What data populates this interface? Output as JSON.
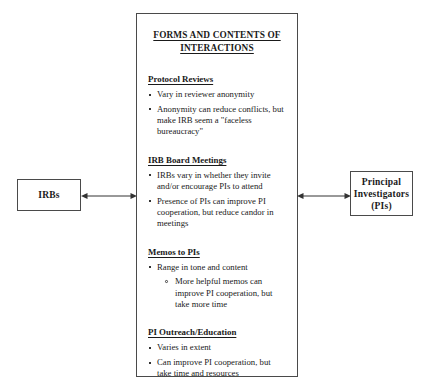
{
  "diagram": {
    "left_box": {
      "label": "IRBs",
      "lines": [
        "IRBs"
      ]
    },
    "right_box": {
      "label": "Principal Investigators (PIs)",
      "lines": [
        "Principal",
        "Investigators",
        "(PIs)"
      ]
    },
    "center_box": {
      "title_lines": [
        "FORMS AND CONTENTS OF",
        "INTERACTIONS"
      ],
      "sections": [
        {
          "heading": "Protocol Reviews",
          "bullets": [
            {
              "text": "Vary in reviewer anonymity",
              "subbullets": []
            },
            {
              "text": "Anonymity can reduce conflicts, but make IRB seem a \"faceless bureaucracy\"",
              "subbullets": []
            }
          ]
        },
        {
          "heading": "IRB Board Meetings",
          "bullets": [
            {
              "text": "IRBs vary in whether they invite and/or encourage PIs to attend",
              "subbullets": []
            },
            {
              "text": "Presence of PIs can improve PI cooperation, but reduce candor in meetings",
              "subbullets": []
            }
          ]
        },
        {
          "heading": "Memos to PIs",
          "bullets": [
            {
              "text": "Range in tone and content",
              "subbullets": [
                "More helpful memos can improve PI cooperation, but take more time"
              ]
            }
          ]
        },
        {
          "heading": "PI Outreach/Education",
          "bullets": [
            {
              "text": "Varies in extent",
              "subbullets": []
            },
            {
              "text": "Can improve PI cooperation, but take time and resources",
              "subbullets": []
            }
          ]
        }
      ]
    },
    "connectors": [
      {
        "name": "irbs-to-center",
        "style": "double-headed-arrow"
      },
      {
        "name": "center-to-pis",
        "style": "double-headed-arrow"
      }
    ],
    "colors": {
      "background": "#ffffff",
      "border": "#4a4a4a",
      "text": "#1a1a1a",
      "arrow": "#333333"
    }
  }
}
